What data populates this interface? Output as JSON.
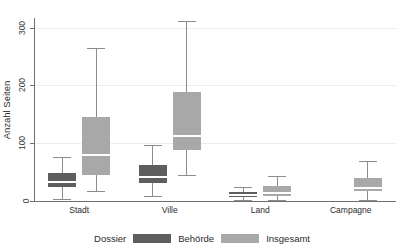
{
  "title": {
    "text": "",
    "note": "cut-off-at-top"
  },
  "axes": {
    "y_label": "Anzahl Seiten",
    "y_ticks": [
      "0",
      "100",
      "200",
      "300"
    ],
    "x_ticks": [
      "Stadt",
      "Ville",
      "Land",
      "Campagne"
    ]
  },
  "legend": {
    "title": "Dossier",
    "entries": [
      {
        "label": "Behörde",
        "color": "#5e5e5e"
      },
      {
        "label": "Insgesamt",
        "color": "#a8a8a8"
      }
    ]
  },
  "colors": {
    "behoerde": "#5e5e5e",
    "insgesamt": "#a8a8a8",
    "whisker": "#8c8c8c",
    "axis": "#6f6f6f",
    "grid": "#ededed",
    "median": "#ffffff"
  },
  "chart_data": {
    "type": "box",
    "title": "",
    "xlabel": "",
    "ylabel": "Anzahl Seiten",
    "ylim": [
      0,
      320
    ],
    "y_ticks": [
      0,
      100,
      200,
      300
    ],
    "grid": "horizontal",
    "legend_position": "bottom",
    "categories": [
      "Stadt",
      "Ville",
      "Land",
      "Campagne"
    ],
    "series": [
      {
        "name": "Behörde",
        "color": "#5e5e5e",
        "boxes": [
          {
            "category": "Stadt",
            "whisker_low": 4,
            "q1": 24,
            "median": 33,
            "q3": 48,
            "whisker_high": 76
          },
          {
            "category": "Ville",
            "whisker_low": 9,
            "q1": 31,
            "median": 41,
            "q3": 62,
            "whisker_high": 97
          },
          {
            "category": "Land",
            "whisker_low": 2,
            "q1": 7,
            "median": 10,
            "q3": 16,
            "whisker_high": 24
          },
          {
            "category": "Campagne",
            "whisker_low": null,
            "q1": null,
            "median": null,
            "q3": null,
            "whisker_high": null
          }
        ]
      },
      {
        "name": "Insgesamt",
        "color": "#a8a8a8",
        "boxes": [
          {
            "category": "Stadt",
            "whisker_low": 18,
            "q1": 45,
            "median": 80,
            "q3": 145,
            "whisker_high": 265
          },
          {
            "category": "Ville",
            "whisker_low": 45,
            "q1": 88,
            "median": 112,
            "q3": 188,
            "whisker_high": 311
          },
          {
            "category": "Land",
            "whisker_low": 1,
            "q1": 8,
            "median": 13,
            "q3": 26,
            "whisker_high": 44
          },
          {
            "category": "Campagne",
            "whisker_low": 1,
            "q1": 17,
            "median": 23,
            "q3": 39,
            "whisker_high": 70
          }
        ]
      }
    ]
  }
}
